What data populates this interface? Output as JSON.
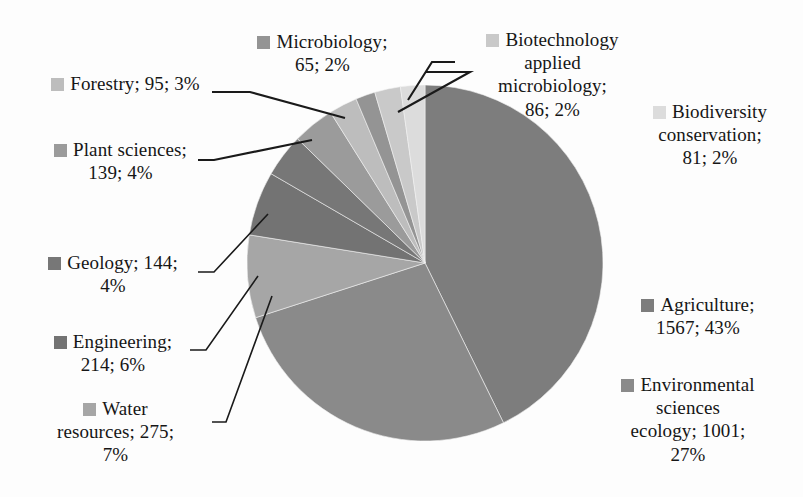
{
  "chart_data": {
    "type": "pie",
    "title": "",
    "legend_position": "callout-labels",
    "label_format": "name; value; percent",
    "total": 3668,
    "categories": [
      "Agriculture",
      "Environmental sciences ecology",
      "Water resources",
      "Engineering",
      "Geology",
      "Plant sciences",
      "Forestry",
      "Microbiology",
      "Biotechnology applied microbiology",
      "Biodiversity conservation"
    ],
    "values": [
      1567,
      1001,
      275,
      214,
      144,
      139,
      95,
      65,
      86,
      81
    ],
    "percents": [
      43,
      27,
      7,
      6,
      4,
      4,
      3,
      2,
      2,
      2
    ],
    "colors": [
      "#7d7d7d",
      "#8a8a8a",
      "#a6a6a6",
      "#737373",
      "#777777",
      "#9b9b9b",
      "#bdbdbd",
      "#949494",
      "#c9c9c9",
      "#dcdcdc"
    ]
  },
  "labels": {
    "microbiology": {
      "line1": "Microbiology;",
      "line2": "65; 2%",
      "color": "#949494"
    },
    "biotechnology": {
      "line1": "Biotechnology",
      "line2": "applied",
      "line3": "microbiology;",
      "line4": "86; 2%",
      "color": "#c9c9c9"
    },
    "biodiversity": {
      "line1": "Biodiversity",
      "line2": "conservation;",
      "line3": "81; 2%",
      "color": "#dcdcdc"
    },
    "forestry": {
      "line1": "Forestry; 95; 3%",
      "color": "#bdbdbd"
    },
    "plant_sciences": {
      "line1": "Plant sciences;",
      "line2": "139; 4%",
      "color": "#9b9b9b"
    },
    "geology": {
      "line1": "Geology; 144;",
      "line2": "4%",
      "color": "#777777"
    },
    "engineering": {
      "line1": "Engineering;",
      "line2": "214; 6%",
      "color": "#737373"
    },
    "water_resources": {
      "line1": "Water",
      "line2": "resources; 275;",
      "line3": "7%",
      "color": "#a6a6a6"
    },
    "agriculture": {
      "line1": "Agriculture;",
      "line2": "1567; 43%",
      "color": "#7d7d7d"
    },
    "environmental": {
      "line1": "Environmental",
      "line2": "sciences",
      "line3": "ecology; 1001;",
      "line4": "27%",
      "color": "#8a8a8a"
    }
  }
}
